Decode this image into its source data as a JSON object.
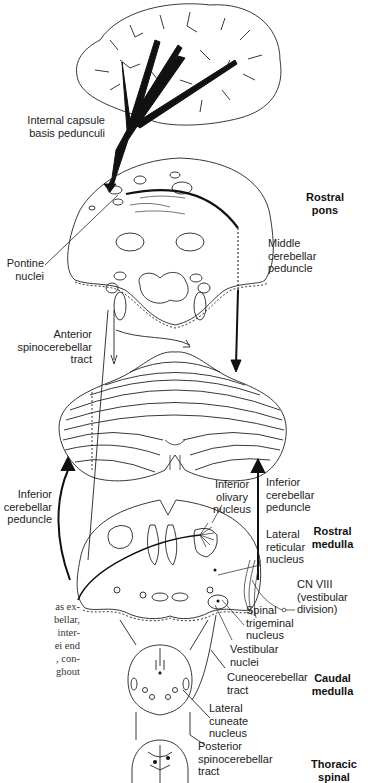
{
  "diagram": {
    "type": "neuroanatomy-pathway",
    "levels": {
      "rostral_pons": "Rostral\npons",
      "rostral_medulla": "Rostral\nmedulla",
      "caudal_medulla": "Caudal\nmedulla",
      "thoracic_spinal": "Thoracic\nspinal"
    },
    "labels": {
      "internal_capsule": "Internal capsule\nbasis pedunculi",
      "pontine_nuclei": "Pontine\nnuclei",
      "middle_cerebellar_peduncle": "Middle\ncerebellar\npeduncle",
      "anterior_spinocerebellar_tract": "Anterior\nspinocerebellar\ntract",
      "inferior_cerebellar_peduncle_left": "Inferior\ncerebellar\npeduncle",
      "inferior_cerebellar_peduncle_right": "Inferior\ncerebellar\npeduncle",
      "inferior_olivary_nucleus": "Inferior\nolivary\nnucleus",
      "lateral_reticular_nucleus": "Lateral\nreticular\nnucleus",
      "cn_viii": "CN VIII\n(vestibular\ndivision)",
      "spinal_trigeminal_nucleus": "Spinal\ntrigeminal\nnucleus",
      "vestibular_nuclei": "Vestibular\nnuclei",
      "cuneocerebellar_tract": "Cuneocerebellar\ntract",
      "lateral_cuneate_nucleus": "Lateral\ncuneate\nnucleus",
      "posterior_spinocerebellar_tract": "Posterior\nspinocerebellar\ntract"
    },
    "side_text_fragment": "as ex-\nbellar,\ninter-\nei end\n, con-\nghout"
  }
}
